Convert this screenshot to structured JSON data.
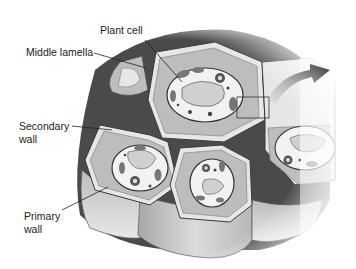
{
  "diagram": {
    "labels": {
      "plant_cell": "Plant cell",
      "middle_lamella": "Middle lamella",
      "secondary_wall_line1": "Secondary",
      "secondary_wall_line2": "wall",
      "primary_wall_line1": "Primary",
      "primary_wall_line2": "wall"
    },
    "callouts": [
      {
        "label": "Plant cell",
        "points_to": "central cell cytoplasm"
      },
      {
        "label": "Middle lamella",
        "points_to": "junction between cell walls"
      },
      {
        "label": "Secondary wall",
        "points_to": "inner wall layer of lower-left cell"
      },
      {
        "label": "Primary wall",
        "points_to": "outer wall layer of lower-left cell"
      }
    ],
    "elements": [
      {
        "type": "cell",
        "name": "central plant cell"
      },
      {
        "type": "cell",
        "name": "lower-left cell"
      },
      {
        "type": "cell",
        "name": "lower-middle cell"
      },
      {
        "type": "cell",
        "name": "right partial cell"
      },
      {
        "type": "cell",
        "name": "upper-left partial cell"
      },
      {
        "type": "highlight-box",
        "name": "magnified region marker"
      },
      {
        "type": "arrow",
        "name": "magnification arrow",
        "direction": "up-right"
      }
    ],
    "colors": {
      "background": "#ffffff",
      "wall_fill": "#bdbdbd",
      "wall_light": "#e6e6e6",
      "middle_lamella": "#4a4a4a",
      "cytoplasm": "#f2f2f2",
      "vacuole": "#d0d0d0",
      "organelle": "#555555",
      "arrow": "#3a3a3a",
      "text": "#222222"
    }
  }
}
